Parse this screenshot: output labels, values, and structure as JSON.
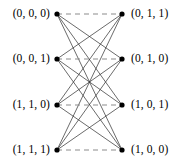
{
  "figure": {
    "type": "bipartite-graph-diagram",
    "title": "",
    "background_color": "#ffffff",
    "ink_color": "#000000",
    "width": 183,
    "height": 166
  },
  "graph": {
    "kind": "complete bipartite K4,4",
    "node_radius": 2.6,
    "node_color": "#000000",
    "solid_edge_color": "#2b2b2b",
    "dashed_edge_color": "#8c8c8c",
    "solid_edge_width": 0.7,
    "dashed_edge_width": 1.1,
    "dash_pattern": "5,4",
    "left_nodes": [
      {
        "id": "L0",
        "label": "(0, 0, 0)",
        "x": 57,
        "y": 14
      },
      {
        "id": "L1",
        "label": "(0, 0, 1)",
        "x": 57,
        "y": 59
      },
      {
        "id": "L2",
        "label": "(1, 1, 0)",
        "x": 57,
        "y": 105
      },
      {
        "id": "L3",
        "label": "(1, 1, 1)",
        "x": 57,
        "y": 150
      }
    ],
    "right_nodes": [
      {
        "id": "R0",
        "label": "(0, 1, 1)",
        "x": 122,
        "y": 14
      },
      {
        "id": "R1",
        "label": "(0, 1, 0)",
        "x": 122,
        "y": 59
      },
      {
        "id": "R2",
        "label": "(1, 0, 1)",
        "x": 122,
        "y": 105
      },
      {
        "id": "R3",
        "label": "(1, 0, 0)",
        "x": 122,
        "y": 150
      }
    ],
    "dashed_edges": [
      {
        "from": "L0",
        "to": "R0"
      },
      {
        "from": "L1",
        "to": "R1"
      },
      {
        "from": "L2",
        "to": "R2"
      },
      {
        "from": "L3",
        "to": "R3"
      }
    ],
    "solid_edges": [
      {
        "from": "L0",
        "to": "R1"
      },
      {
        "from": "L0",
        "to": "R2"
      },
      {
        "from": "L0",
        "to": "R3"
      },
      {
        "from": "L1",
        "to": "R0"
      },
      {
        "from": "L1",
        "to": "R2"
      },
      {
        "from": "L1",
        "to": "R3"
      },
      {
        "from": "L2",
        "to": "R0"
      },
      {
        "from": "L2",
        "to": "R1"
      },
      {
        "from": "L2",
        "to": "R3"
      },
      {
        "from": "L3",
        "to": "R0"
      },
      {
        "from": "L3",
        "to": "R1"
      },
      {
        "from": "L3",
        "to": "R2"
      }
    ]
  },
  "labels": {
    "left": [
      "(0, 0, 0)",
      "(0, 0, 1)",
      "(1, 1, 0)",
      "(1, 1, 1)"
    ],
    "right": [
      "(0, 1, 1)",
      "(0, 1, 0)",
      "(1, 0, 1)",
      "(1, 0, 0)"
    ]
  }
}
